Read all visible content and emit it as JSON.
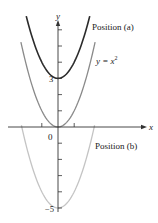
{
  "chart_data": {
    "type": "line",
    "title": "",
    "xlabel": "x",
    "ylabel": "y",
    "xlim": [
      -3.1,
      5.3
    ],
    "ylim": [
      -5.2,
      7.0
    ],
    "grid": false,
    "x_ticks": [
      -1,
      1
    ],
    "y_ticks": [
      -5,
      -4,
      -3,
      -2,
      -1,
      1,
      2,
      3,
      4,
      5,
      6
    ],
    "tick_labels": {
      "origin": "0",
      "y3": "3",
      "yneg5": "−5"
    },
    "series": [
      {
        "name": "Position (a)",
        "equation": "y = x^2 + 3",
        "shift": 3,
        "color": "#2b2b2b",
        "x": [
          -1.96,
          -1,
          0,
          1,
          1.96
        ],
        "y": [
          6.85,
          4,
          3,
          4,
          6.85
        ]
      },
      {
        "name": "y = x^2",
        "equation": "y = x^2",
        "shift": 0,
        "color": "#8a8a8a",
        "x": [
          -2.29,
          -1,
          0,
          1,
          2.29
        ],
        "y": [
          5.25,
          1,
          0,
          1,
          5.25
        ]
      },
      {
        "name": "Position (b)",
        "equation": "y = x^2 - 5",
        "shift": -5,
        "color": "#c4c4c4",
        "x": [
          -2.26,
          -1,
          0,
          1,
          2.26
        ],
        "y": [
          0.1,
          -4,
          -5,
          -4,
          0.1
        ]
      }
    ],
    "annotations": [
      {
        "text": "Position (a)",
        "near": "upper curve"
      },
      {
        "text": "y = x",
        "superscript": "2",
        "near": "middle curve"
      },
      {
        "text": "Position (b)",
        "near": "lower curve"
      }
    ]
  },
  "labels": {
    "axis_x": "x",
    "axis_y": "y",
    "origin": "0",
    "tick_3": "3",
    "tick_neg5": "−5",
    "position_a": "Position (a)",
    "eq_base": "y = x",
    "eq_exp": "2",
    "position_b": "Position (b)"
  }
}
